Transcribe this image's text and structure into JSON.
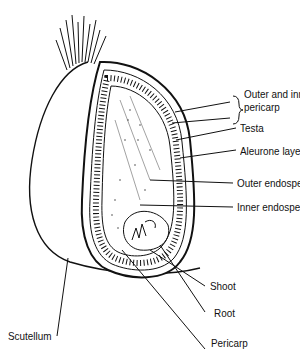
{
  "diagram": {
    "labels": {
      "outer_inner_pericarp_1": "Outer and inner",
      "outer_inner_pericarp_2": "pericarp",
      "testa": "Testa",
      "aleurone": "Aleurone layer",
      "outer_endosperm": "Outer endosperm",
      "inner_endosperm": "Inner endosperm",
      "shoot": "Shoot",
      "root": "Root",
      "scutellum": "Scutellum",
      "pericarp": "Pericarp"
    }
  }
}
